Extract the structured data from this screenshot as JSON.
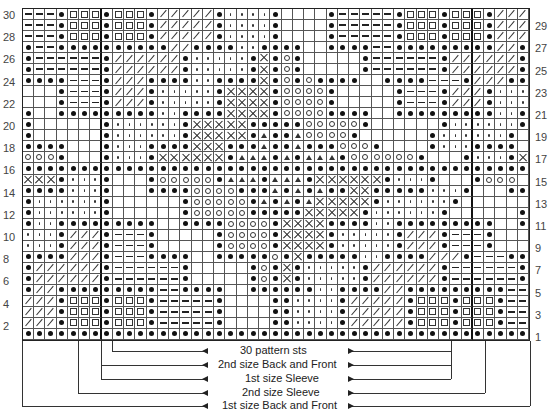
{
  "chart": {
    "type": "knitting-chart",
    "columns": 45,
    "rows_count": 30,
    "symbol_key": {
      ".": "blank",
      "o": "filled-dot",
      "-": "dash",
      "q": "small-square",
      "/": "slash",
      ":": "small-dot",
      "x": "cross",
      "c": "open-circle",
      "t": "triangle"
    },
    "rows": [
      {
        "n": 30,
        "cells": "---oqqqoqqqo/////o::::o....o-----oqqqoqqqo///"
      },
      {
        "n": 29,
        "cells": "---oqqqoqqqo/////o::::o....o-----oqqqoqqqo///"
      },
      {
        "n": 28,
        "cells": "---oqqqoqqqo/////o::::o....o-----oqqqoqqqo///"
      },
      {
        "n": 27,
        "cells": "o--oooooooooo//oooo::oooo..oooo--ooooooooo//o"
      },
      {
        "n": 26,
        "cells": "o------o//////o:::::oxoco.....o------o//////o"
      },
      {
        "n": 25,
        "cells": "o------o//////o:::::oxoco.....o------o//////o"
      },
      {
        "n": 24,
        "cells": "oooo---o///oooo::ooooxococoooo..oooo---o///oooo"
      },
      {
        "n": 23,
        "cells": "...o---o///o:::::oxxxxocccco.....o---o///o:::"
      },
      {
        "n": 22,
        "cells": "...o---o///o:::::oxxxxocccco.....o---o///o:::"
      },
      {
        "n": 21,
        "cells": "o..ooooooooo::ooooxxxxoccccoooo..ooooooooo::o"
      },
      {
        "n": 20,
        "cells": "o......o::::::oxxxxxoooooccccco......o::::::o"
      },
      {
        "n": 19,
        "cells": "o......o::::::oxxxxxotootcccco......o::::::o"
      },
      {
        "n": 18,
        "cells": "oooo...o:::ooooxxxoootootoooccco....o:::oooo"
      },
      {
        "n": 17,
        "cells": "ccco...o:::oxxxxxxotttototttocccccco...o:::oxxx"
      },
      {
        "n": 16,
        "cells": "ooooooooooooooooooooooooooooooooooooooooooooo"
      },
      {
        "n": 15,
        "cells": "xxxo:::o...occcccotttotttoxxxxxxo:::o...occc"
      },
      {
        "n": 14,
        "cells": "oooo:::o...ooooccccoootototooxxooooo:::o...oooo"
      },
      {
        "n": 13,
        "cells": "o::::::o......occcccotototxxxxxo::::::o......o"
      },
      {
        "n": 12,
        "cells": "o::::::o......occcccoooooxxxxxo::::::o......o"
      },
      {
        "n": 11,
        "cells": "o::ooooooooo..ooooccccoxxxxoooo::ooooooooo..o"
      },
      {
        "n": 10,
        "cells": ":::o///o---o.....occccoxxxxo:::::o///o---o..."
      },
      {
        "n": 9,
        "cells": ":::o///o---o.....occccoxxxxo:::::o///o---o..."
      },
      {
        "n": 8,
        "cells": "oooo///o---oooo..ooooocoxooooo::oooo///o---oooo"
      },
      {
        "n": 7,
        "cells": "o//////o------o.....ocoxo:::::o//////o------o"
      },
      {
        "n": 6,
        "cells": "o//////o------o.....ocoxo:::::o//////o------o"
      },
      {
        "n": 5,
        "cells": "o//ooooooooo--oooo..oooooo::oooo//ooooooooo--o"
      },
      {
        "n": 4,
        "cells": "///oqqqoqqqo-----o....oo::::o/////oqqqoqqqo---"
      },
      {
        "n": 3,
        "cells": "///oqqqoqqqo-----o....oo::::o/////oqqqoqqqo---"
      },
      {
        "n": 2,
        "cells": "///oqqqoqqqo-----o....oo::::o/////oqqqoqqqo---"
      },
      {
        "n": 1,
        "cells": "ooooooooooooooooooooooooooooooooooooooooooooo"
      }
    ],
    "left_row_labels": [
      "30",
      "28",
      "26",
      "24",
      "22",
      "20",
      "18",
      "16",
      "14",
      "12",
      "10",
      "8",
      "6",
      "4",
      "2"
    ],
    "right_row_labels": [
      "29",
      "27",
      "25",
      "23",
      "21",
      "19",
      "17",
      "15",
      "13",
      "11",
      "9",
      "7",
      "5",
      "3",
      "1"
    ],
    "thick_column_lines_after": [
      7,
      40
    ]
  },
  "size_guides": [
    {
      "label": "30 pattern sts",
      "from_col": 9,
      "to_col": 38
    },
    {
      "label": "2nd size Back and Front",
      "from_col": 8,
      "to_col": 38
    },
    {
      "label": "1st size Sleeve",
      "from_col": 8,
      "to_col": 38
    },
    {
      "label": "2nd size Sleeve",
      "from_col": 6,
      "to_col": 41
    },
    {
      "label": "1st size Back and Front",
      "from_col": 1,
      "to_col": 45
    }
  ]
}
